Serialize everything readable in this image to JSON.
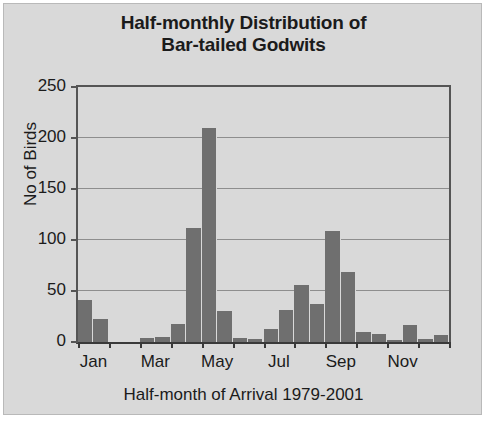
{
  "chart_data": {
    "type": "bar",
    "title": "Half-monthly Distribution of Bar-tailed Godwits",
    "title_line1": "Half-monthly Distribution of",
    "title_line2": "Bar-tailed Godwits",
    "xlabel": "Half-month of Arrival 1979-2001",
    "ylabel": "No of Birds",
    "ylim": [
      0,
      250
    ],
    "yticks": [
      0,
      50,
      100,
      150,
      200,
      250
    ],
    "ytick_labels": [
      "0",
      "50",
      "100",
      "150",
      "200",
      "250"
    ],
    "grid": true,
    "legend": "none",
    "bar_color": "#6f6f6f",
    "plot_background": "#d9d9d9",
    "xtick_labels": [
      "Jan",
      "Mar",
      "May",
      "Jul",
      "Sep",
      "Nov"
    ],
    "categories": [
      "Jan-1",
      "Jan-2",
      "Feb-1",
      "Feb-2",
      "Mar-1",
      "Mar-2",
      "Apr-1",
      "Apr-2",
      "May-1",
      "May-2",
      "Jun-1",
      "Jun-2",
      "Jul-1",
      "Jul-2",
      "Aug-1",
      "Aug-2",
      "Sep-1",
      "Sep-2",
      "Oct-1",
      "Oct-2",
      "Nov-1",
      "Nov-2",
      "Dec-1",
      "Dec-2"
    ],
    "values": [
      41,
      23,
      0,
      0,
      4,
      5,
      18,
      112,
      210,
      30,
      4,
      3,
      13,
      31,
      56,
      37,
      109,
      69,
      10,
      8,
      2,
      17,
      3,
      7
    ]
  }
}
